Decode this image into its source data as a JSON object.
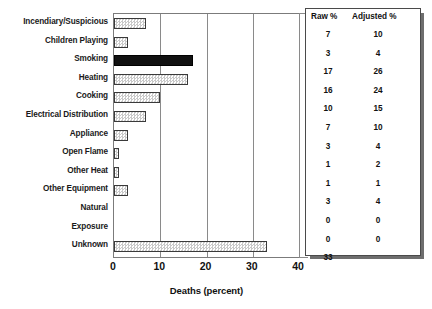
{
  "chart_data": {
    "type": "bar",
    "orientation": "horizontal",
    "title": "",
    "xlabel": "Deaths (percent)",
    "ylabel": "",
    "xlim": [
      0,
      40
    ],
    "xticks": [
      0,
      10,
      20,
      30,
      40
    ],
    "grid": true,
    "legend": false,
    "categories": [
      "Incendiary/Suspicious",
      "Children Playing",
      "Smoking",
      "Heating",
      "Cooking",
      "Electrical Distribution",
      "Appliance",
      "Open Flame",
      "Other Heat",
      "Other Equipment",
      "Natural",
      "Exposure",
      "Unknown"
    ],
    "values": [
      7,
      3,
      17,
      16,
      10,
      7,
      3,
      1,
      1,
      3,
      0,
      0,
      33
    ],
    "highlight_category": "Smoking",
    "bar_fill": "stipple-pattern",
    "highlight_fill": "solid-black"
  },
  "axis": {
    "tick_labels": [
      "0",
      "10",
      "20",
      "30",
      "40"
    ],
    "title": "Deaths (percent)"
  },
  "categories": [
    "Incendiary/Suspicious",
    "Children Playing",
    "Smoking",
    "Heating",
    "Cooking",
    "Electrical Distribution",
    "Appliance",
    "Open Flame",
    "Other Heat",
    "Other Equipment",
    "Natural",
    "Exposure",
    "Unknown"
  ],
  "table": {
    "headers": [
      "Raw %",
      "Adjusted %"
    ],
    "rows": [
      {
        "raw": "7",
        "adjusted": "10"
      },
      {
        "raw": "3",
        "adjusted": "4"
      },
      {
        "raw": "17",
        "adjusted": "26"
      },
      {
        "raw": "16",
        "adjusted": "24"
      },
      {
        "raw": "10",
        "adjusted": "15"
      },
      {
        "raw": "7",
        "adjusted": "10"
      },
      {
        "raw": "3",
        "adjusted": "4"
      },
      {
        "raw": "1",
        "adjusted": "2"
      },
      {
        "raw": "1",
        "adjusted": "1"
      },
      {
        "raw": "3",
        "adjusted": "4"
      },
      {
        "raw": "0",
        "adjusted": "0"
      },
      {
        "raw": "0",
        "adjusted": "0"
      },
      {
        "raw": "33",
        "adjusted": ""
      }
    ]
  },
  "colors": {
    "bar_border": "#3a3a3a",
    "bar_fill": "#d6d6d6",
    "highlight": "#111111",
    "axis": "#7b7b7b",
    "text": "#111111",
    "panel_shadow": "#6e6e6e"
  }
}
